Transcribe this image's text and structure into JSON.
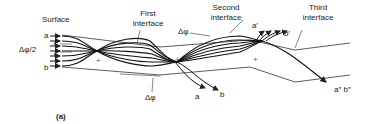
{
  "figure": {
    "panel_label": "(a)",
    "labels": {
      "surface": "Surface",
      "first_interface": [
        "First",
        "interface"
      ],
      "second_interface": [
        "Second",
        "interface"
      ],
      "third_interface": [
        "Third",
        "interface"
      ],
      "ray_a": "a",
      "ray_b": "b",
      "half_delta_phi": "Δφ/2",
      "delta_phi_lower": "Δφ",
      "delta_phi_upper": "Δφ",
      "out_a": "a",
      "out_b": "b",
      "out_a_prime": "a′",
      "out_b_prime": "b′",
      "out_a_b_double_prime": "a″ b″",
      "plus_markers": [
        "+",
        "+",
        "+"
      ]
    },
    "colors": {
      "ink": "#222222",
      "background": "#ffffff"
    }
  }
}
